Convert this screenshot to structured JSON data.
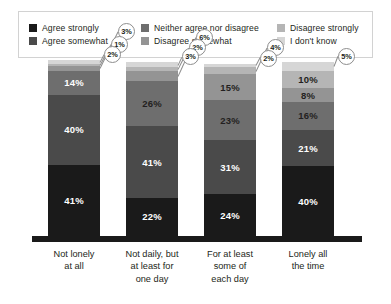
{
  "legend": {
    "columns": [
      [
        {
          "label": "Agree strongly",
          "color": "#1a1a1a",
          "key": "agree_strongly"
        },
        {
          "label": "Agree somewhat",
          "color": "#4a4a4a",
          "key": "agree_somewhat"
        }
      ],
      [
        {
          "label": "Neither agree nor disagree",
          "color": "#6e6e6e",
          "key": "neither"
        },
        {
          "label": "Disagree somewhat",
          "color": "#949494",
          "key": "disagree_somewhat"
        }
      ],
      [
        {
          "label": "Disagree strongly",
          "color": "#b5b5b5",
          "key": "disagree_strongly"
        },
        {
          "label": "I don't know",
          "color": "#d6d6d6",
          "key": "dont_know"
        }
      ]
    ]
  },
  "chart_data": {
    "type": "bar",
    "subtype": "stacked-100-percent",
    "title": "",
    "xlabel": "",
    "ylabel": "",
    "ylim": [
      0,
      100
    ],
    "grid": false,
    "legend_position": "top",
    "categories": [
      "Not lonely at all",
      "Not daily, but at least for one day",
      "For at least some of each day",
      "Lonely all the time"
    ],
    "category_lines": [
      [
        "Not lonely",
        "at all"
      ],
      [
        "Not daily, but",
        "at least for",
        "one day"
      ],
      [
        "For at least",
        "some of",
        "each day"
      ],
      [
        "Lonely all",
        "the time"
      ]
    ],
    "series": [
      {
        "name": "Agree strongly",
        "color": "#1a1a1a",
        "values": [
          41,
          22,
          24,
          40
        ]
      },
      {
        "name": "Agree somewhat",
        "color": "#4a4a4a",
        "values": [
          40,
          41,
          31,
          21
        ]
      },
      {
        "name": "Neither agree nor disagree",
        "color": "#6e6e6e",
        "values": [
          14,
          26,
          23,
          16
        ]
      },
      {
        "name": "Disagree somewhat",
        "color": "#949494",
        "values": [
          3,
          6,
          15,
          8
        ]
      },
      {
        "name": "Disagree strongly",
        "color": "#b5b5b5",
        "values": [
          1,
          2,
          4,
          10
        ]
      },
      {
        "name": "I don't know",
        "color": "#d6d6d6",
        "values": [
          2,
          3,
          2,
          5
        ]
      }
    ],
    "value_suffix": "%",
    "bars": [
      {
        "category": "Not lonely at all",
        "segments": [
          {
            "name": "Agree strongly",
            "value": "41%",
            "pct": 41,
            "color": "#1a1a1a",
            "label_style": "inside-light"
          },
          {
            "name": "Agree somewhat",
            "value": "40%",
            "pct": 40,
            "color": "#4a4a4a",
            "label_style": "inside-light"
          },
          {
            "name": "Neither agree nor disagree",
            "value": "14%",
            "pct": 14,
            "color": "#6e6e6e",
            "label_style": "inside-light"
          },
          {
            "name": "Disagree somewhat",
            "value": "3%",
            "pct": 3,
            "color": "#949494",
            "label_style": "callout"
          },
          {
            "name": "Disagree strongly",
            "value": "1%",
            "pct": 1,
            "color": "#b5b5b5",
            "label_style": "callout"
          },
          {
            "name": "I don't know",
            "value": "2%",
            "pct": 2,
            "color": "#d6d6d6",
            "label_style": "callout"
          }
        ]
      },
      {
        "category": "Not daily, but at least for one day",
        "segments": [
          {
            "name": "Agree strongly",
            "value": "22%",
            "pct": 22,
            "color": "#1a1a1a",
            "label_style": "inside-light"
          },
          {
            "name": "Agree somewhat",
            "value": "41%",
            "pct": 41,
            "color": "#4a4a4a",
            "label_style": "inside-light"
          },
          {
            "name": "Neither agree nor disagree",
            "value": "26%",
            "pct": 26,
            "color": "#6e6e6e",
            "label_style": "inside-dark"
          },
          {
            "name": "Disagree somewhat",
            "value": "6%",
            "pct": 6,
            "color": "#949494",
            "label_style": "callout"
          },
          {
            "name": "Disagree strongly",
            "value": "2%",
            "pct": 2,
            "color": "#b5b5b5",
            "label_style": "callout"
          },
          {
            "name": "I don't know",
            "value": "3%",
            "pct": 3,
            "color": "#d6d6d6",
            "label_style": "callout"
          }
        ]
      },
      {
        "category": "For at least some of each day",
        "segments": [
          {
            "name": "Agree strongly",
            "value": "24%",
            "pct": 24,
            "color": "#1a1a1a",
            "label_style": "inside-light"
          },
          {
            "name": "Agree somewhat",
            "value": "31%",
            "pct": 31,
            "color": "#4a4a4a",
            "label_style": "inside-light"
          },
          {
            "name": "Neither agree nor disagree",
            "value": "23%",
            "pct": 23,
            "color": "#6e6e6e",
            "label_style": "inside-dark"
          },
          {
            "name": "Disagree somewhat",
            "value": "15%",
            "pct": 15,
            "color": "#949494",
            "label_style": "inside-dark"
          },
          {
            "name": "Disagree strongly",
            "value": "4%",
            "pct": 4,
            "color": "#b5b5b5",
            "label_style": "callout"
          },
          {
            "name": "I don't know",
            "value": "2%",
            "pct": 2,
            "color": "#d6d6d6",
            "label_style": "callout"
          }
        ]
      },
      {
        "category": "Lonely all the time",
        "segments": [
          {
            "name": "Agree strongly",
            "value": "40%",
            "pct": 40,
            "color": "#1a1a1a",
            "label_style": "inside-light"
          },
          {
            "name": "Agree somewhat",
            "value": "21%",
            "pct": 21,
            "color": "#4a4a4a",
            "label_style": "inside-light"
          },
          {
            "name": "Neither agree nor disagree",
            "value": "16%",
            "pct": 16,
            "color": "#6e6e6e",
            "label_style": "inside-dark"
          },
          {
            "name": "Disagree somewhat",
            "value": "8%",
            "pct": 8,
            "color": "#949494",
            "label_style": "inside-dark"
          },
          {
            "name": "Disagree strongly",
            "value": "10%",
            "pct": 10,
            "color": "#b5b5b5",
            "label_style": "inside-dark"
          },
          {
            "name": "I don't know",
            "value": "5%",
            "pct": 5,
            "color": "#d6d6d6",
            "label_style": "callout"
          }
        ]
      }
    ]
  }
}
